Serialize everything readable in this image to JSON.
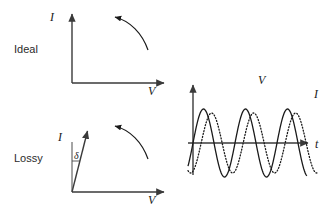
{
  "figure": {
    "width": 331,
    "height": 220,
    "background": "#ffffff",
    "ink_color": "#1a1a1a"
  },
  "panels": {
    "ideal": {
      "row_label": "Ideal",
      "y_axis_label": "I",
      "x_axis_label": "V",
      "origin": {
        "x": 72,
        "y": 83
      },
      "y_axis_top": {
        "x": 72,
        "y": 12
      },
      "x_axis_right": {
        "x": 166,
        "y": 83
      },
      "hysteresis_arc": {
        "start": {
          "x": 148,
          "y": 49
        },
        "end": {
          "x": 113,
          "y": 17
        },
        "arrow_at": "end",
        "description": "capacitor-current-arc"
      }
    },
    "lossy": {
      "row_label": "Lossy",
      "y_axis_label": "I",
      "x_axis_label": "V",
      "angle_label": "δ",
      "origin": {
        "x": 72,
        "y": 192
      },
      "tilted_axis_tip": {
        "x": 88,
        "y": 129
      },
      "vertical_reference_top": {
        "x": 72,
        "y": 142
      },
      "x_axis_right": {
        "x": 166,
        "y": 192
      },
      "hysteresis_arc": {
        "start": {
          "x": 148,
          "y": 158
        },
        "end": {
          "x": 113,
          "y": 126
        },
        "arrow_at": "end",
        "description": "lossy-current-arc"
      }
    },
    "waveform": {
      "v_label": "V",
      "i_label": "I",
      "t_label": "t",
      "origin": {
        "x": 193,
        "y": 143
      },
      "y_axis_top": {
        "x": 193,
        "y": 83
      },
      "t_axis_right": {
        "x": 310,
        "y": 143
      },
      "v_curve": {
        "style": "solid",
        "amplitude": 34,
        "period": 42,
        "phase_deg": 0,
        "x_start": 188,
        "x_end": 307
      },
      "i_curve": {
        "style": "dotted",
        "amplitude": 30,
        "period": 42,
        "phase_deg": -70,
        "x_start": 188,
        "x_end": 318
      }
    }
  },
  "chart_data": {
    "type": "line",
    "xlabel": "t",
    "ylabel": "amplitude",
    "x": [
      0,
      0.25,
      0.5,
      0.75,
      1,
      1.25,
      1.5,
      1.75,
      2,
      2.25,
      2.5,
      2.75,
      3
    ],
    "series": [
      {
        "name": "V",
        "style": "solid",
        "values": [
          0,
          1,
          0,
          -1,
          0,
          1,
          0,
          -1,
          0,
          1,
          0,
          -1,
          0
        ]
      },
      {
        "name": "I",
        "style": "dotted",
        "values": [
          -0.94,
          -0.34,
          0.94,
          0.34,
          -0.94,
          -0.34,
          0.94,
          0.34,
          -0.94,
          -0.34,
          0.94,
          0.34,
          -0.94
        ]
      }
    ],
    "legend": [
      "V",
      "I"
    ],
    "legend_position": "inline-annotation",
    "grid": false,
    "ylim": [
      -1.15,
      1.15
    ]
  }
}
